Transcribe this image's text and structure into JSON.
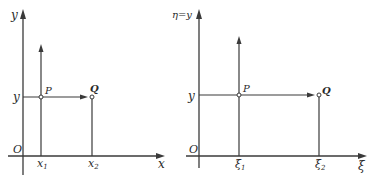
{
  "left_diagram": {
    "y_axis_label": "y",
    "x_axis_label": "x",
    "origin_label": "O",
    "y_tick_label": "y",
    "x1_label": "x",
    "x1_sub": "1",
    "x2_label": "x",
    "x2_sub": "2",
    "point_p_label": "P",
    "point_q_label": "Q"
  },
  "right_diagram": {
    "y_axis_label": "η=y",
    "x_axis_label": "ξ",
    "origin_label": "O",
    "y_tick_label": "y",
    "xi1_label": "ξ",
    "xi1_sub": "1",
    "xi2_label": "ξ",
    "xi2_sub": "2",
    "point_p_label": "P",
    "point_q_label": "Q"
  },
  "colors": {
    "line": "#3a3a3a",
    "background": "#ffffff"
  }
}
